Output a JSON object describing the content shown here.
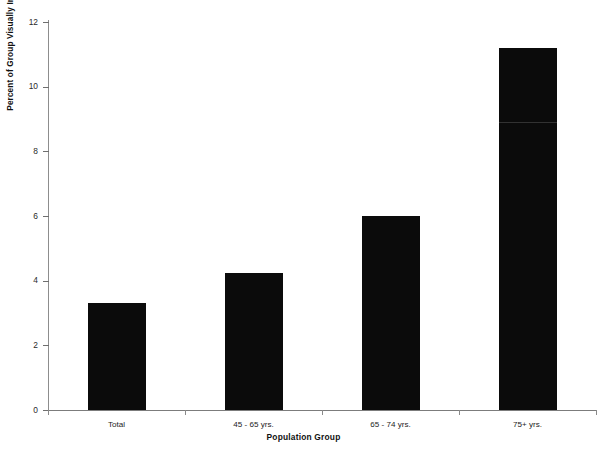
{
  "chart_data": {
    "type": "bar",
    "title": "",
    "subtitle": "",
    "xlabel": "Population Group",
    "ylabel": "Percent of Group Visually Impaired",
    "categories": [
      "Total",
      "45 - 65 yrs.",
      "65 - 74 yrs.",
      "75+ yrs."
    ],
    "values": [
      3.3,
      4.25,
      6.0,
      11.2
    ],
    "ylim": [
      0,
      12
    ],
    "yticks": [
      0,
      2,
      4,
      6,
      8,
      10,
      12
    ],
    "ytick_labels": [
      "0",
      "2",
      "4",
      "6",
      "8",
      "10",
      "12"
    ],
    "grid": false,
    "legend": null,
    "bar_color": "#0b0b0b",
    "background_color": "#ffffff",
    "axis_color": "#8d8d8d"
  },
  "caption": {
    "text": ""
  },
  "icons": {
    "bar_series": "bar-series-icon"
  }
}
